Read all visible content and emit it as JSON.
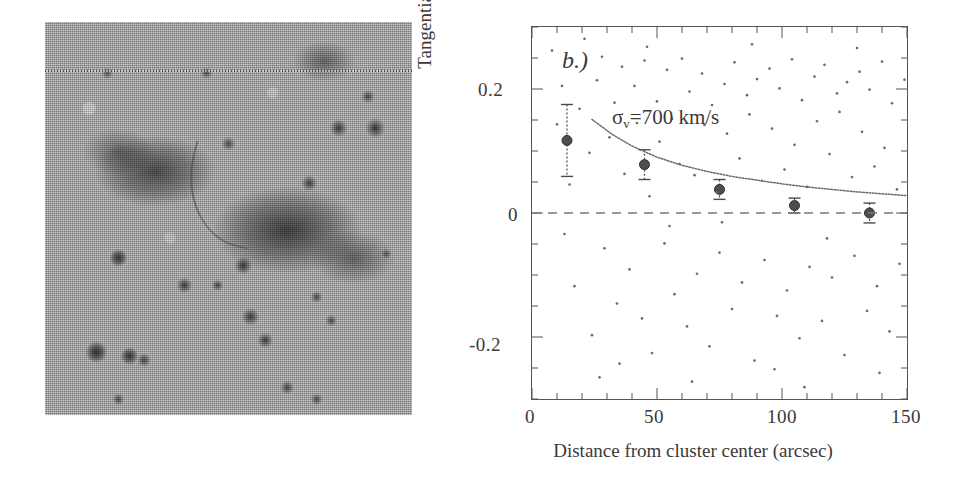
{
  "figure": {
    "panels": [
      {
        "id": "a",
        "type": "image",
        "description": "halftone astronomical image of a galaxy cluster field with an elongated arc feature"
      },
      {
        "id": "b",
        "type": "scatter-with-binned-errorbars"
      }
    ]
  },
  "panel_a": {
    "name": "cluster-field-image",
    "alt": "grayscale halftone optical image of a galaxy cluster field"
  },
  "panel_b": {
    "tag": "b.)",
    "annotation": "σ",
    "annotation_sub": "v",
    "annotation_rest": "=700 km/s"
  },
  "chart_data": {
    "type": "scatter",
    "title": "b.)",
    "xlabel": "Distance from cluster center (arcsec)",
    "ylabel": "Tangential polarization",
    "xlim": [
      0,
      150
    ],
    "ylim": [
      -0.3,
      0.3
    ],
    "xticks": [
      0,
      50,
      100,
      150
    ],
    "xtick_labels": [
      "0",
      "50",
      "100",
      "150"
    ],
    "yticks": [
      0.2,
      0,
      -0.2
    ],
    "ytick_labels": [
      "0.2",
      "0",
      "-0.2"
    ],
    "grid": false,
    "legend": null,
    "annotations": [
      {
        "text": "b.)",
        "x": 12,
        "y": 0.26,
        "style": "italic"
      },
      {
        "text": "σ_v=700 km/s",
        "x": 34,
        "y": 0.175
      }
    ],
    "series": [
      {
        "name": "binned tangential polarization",
        "type": "errorbar",
        "marker": "filled-circle",
        "x": [
          14,
          45,
          75,
          105,
          135
        ],
        "y": [
          0.117,
          0.078,
          0.038,
          0.012,
          0.0
        ],
        "yerr": [
          0.058,
          0.024,
          0.016,
          0.012,
          0.016
        ]
      },
      {
        "name": "isothermal sphere model",
        "type": "line",
        "linestyle": "dotted",
        "label": "σ_v=700 km/s",
        "x": [
          24,
          32,
          40,
          50,
          60,
          70,
          80,
          90,
          100,
          110,
          120,
          130,
          140,
          150
        ],
        "y": [
          0.151,
          0.127,
          0.108,
          0.09,
          0.077,
          0.067,
          0.059,
          0.053,
          0.047,
          0.042,
          0.038,
          0.034,
          0.031,
          0.028
        ]
      },
      {
        "name": "zero reference line",
        "type": "hline",
        "linestyle": "dashed",
        "y": 0.0
      },
      {
        "name": "individual galaxy measurements",
        "type": "points",
        "marker": "dot",
        "points": [
          [
            8,
            0.262
          ],
          [
            12,
            0.205
          ],
          [
            15,
            0.046
          ],
          [
            17,
            -0.118
          ],
          [
            19,
            0.168
          ],
          [
            21,
            0.281
          ],
          [
            23,
            0.097
          ],
          [
            24,
            -0.197
          ],
          [
            26,
            0.214
          ],
          [
            28,
            0.252
          ],
          [
            29,
            -0.057
          ],
          [
            31,
            0.122
          ],
          [
            33,
            0.178
          ],
          [
            34,
            -0.146
          ],
          [
            36,
            0.236
          ],
          [
            37,
            0.063
          ],
          [
            39,
            -0.091
          ],
          [
            41,
            0.205
          ],
          [
            42,
            0.145
          ],
          [
            44,
            -0.17
          ],
          [
            45,
            0.246
          ],
          [
            47,
            0.027
          ],
          [
            48,
            -0.226
          ],
          [
            50,
            0.18
          ],
          [
            51,
            0.115
          ],
          [
            53,
            -0.049
          ],
          [
            54,
            0.231
          ],
          [
            56,
            0.152
          ],
          [
            57,
            -0.131
          ],
          [
            59,
            0.079
          ],
          [
            60,
            0.249
          ],
          [
            62,
            -0.183
          ],
          [
            63,
            0.196
          ],
          [
            65,
            0.061
          ],
          [
            66,
            -0.098
          ],
          [
            68,
            0.225
          ],
          [
            69,
            0.142
          ],
          [
            71,
            -0.215
          ],
          [
            72,
            0.174
          ],
          [
            74,
            0.033
          ],
          [
            75,
            -0.064
          ],
          [
            77,
            0.208
          ],
          [
            78,
            0.128
          ],
          [
            80,
            -0.155
          ],
          [
            81,
            0.243
          ],
          [
            83,
            0.088
          ],
          [
            84,
            -0.112
          ],
          [
            86,
            0.19
          ],
          [
            87,
            0.159
          ],
          [
            89,
            -0.238
          ],
          [
            90,
            0.216
          ],
          [
            92,
            0.052
          ],
          [
            93,
            -0.076
          ],
          [
            95,
            0.233
          ],
          [
            96,
            0.136
          ],
          [
            98,
            -0.166
          ],
          [
            99,
            0.201
          ],
          [
            101,
            0.07
          ],
          [
            102,
            -0.125
          ],
          [
            104,
            0.248
          ],
          [
            105,
            0.11
          ],
          [
            107,
            -0.202
          ],
          [
            108,
            0.182
          ],
          [
            110,
            0.042
          ],
          [
            111,
            -0.087
          ],
          [
            113,
            0.22
          ],
          [
            114,
            0.148
          ],
          [
            116,
            -0.174
          ],
          [
            117,
            0.239
          ],
          [
            119,
            0.095
          ],
          [
            120,
            -0.104
          ],
          [
            122,
            0.193
          ],
          [
            123,
            0.163
          ],
          [
            125,
            -0.229
          ],
          [
            126,
            0.211
          ],
          [
            128,
            0.058
          ],
          [
            129,
            -0.069
          ],
          [
            131,
            0.228
          ],
          [
            132,
            0.131
          ],
          [
            134,
            -0.158
          ],
          [
            135,
            0.199
          ],
          [
            137,
            0.075
          ],
          [
            138,
            -0.118
          ],
          [
            140,
            0.244
          ],
          [
            141,
            0.105
          ],
          [
            143,
            -0.191
          ],
          [
            144,
            0.177
          ],
          [
            146,
            0.038
          ],
          [
            147,
            -0.082
          ],
          [
            149,
            0.215
          ],
          [
            10,
            0.143
          ],
          [
            13,
            -0.034
          ],
          [
            35,
            -0.243
          ],
          [
            55,
            -0.021
          ],
          [
            76,
            -0.015
          ],
          [
            97,
            -0.252
          ],
          [
            118,
            -0.041
          ],
          [
            139,
            -0.258
          ],
          [
            27,
            -0.265
          ],
          [
            64,
            -0.272
          ],
          [
            88,
            0.272
          ],
          [
            109,
            -0.281
          ],
          [
            130,
            0.266
          ],
          [
            46,
            0.268
          ]
        ]
      }
    ]
  }
}
